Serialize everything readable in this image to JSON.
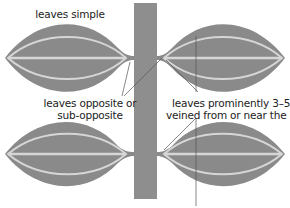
{
  "diagram": {
    "labels": {
      "simple": "leaves simple",
      "opposite_line1": "leaves opposite or",
      "opposite_line2": "sub-opposite",
      "veined_line1": "leaves prominently 3–5-",
      "veined_line2": "veined from or near the base"
    },
    "colors": {
      "leaf_fill": "#8a8a8a",
      "stem_fill": "#8e8e8e",
      "vein": "#d6d6d6",
      "leader_line": "#555555",
      "text": "#222222"
    }
  }
}
